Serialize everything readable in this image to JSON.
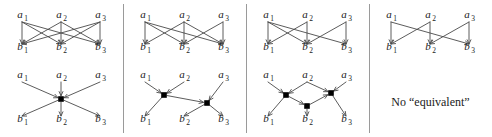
{
  "figure": {
    "width": 492,
    "height": 137,
    "background": "#ffffff",
    "edge_color": "#4a4a4a",
    "node_color": "#000000",
    "divider_color": "#9a9a9a",
    "text_color": "#1a1a1a"
  },
  "labels": {
    "a1": "a",
    "a1sub": "1",
    "a2": "a",
    "a2sub": "2",
    "a3": "a",
    "a3sub": "3",
    "b1": "b",
    "b1sub": "1",
    "b2": "b",
    "b2sub": "2",
    "b3": "b",
    "b3sub": "3"
  },
  "geometry": {
    "panel_width": 123,
    "a_xs": [
      22,
      61,
      100
    ],
    "b_xs": [
      22,
      61,
      100
    ],
    "top": {
      "a_y": 18,
      "b_y": 50,
      "edge_start_y": 22,
      "edge_end_y": 44
    },
    "bottom": {
      "a_y": 78,
      "b_y": 122,
      "edge_start_y": 82,
      "edge_end_y": 116
    }
  },
  "panels": [
    {
      "id": "panel-1-top",
      "name": "complete-bipartite-graph",
      "row": "top",
      "column": 0,
      "type": "bipartite",
      "edges": [
        {
          "from": 0,
          "to": 0
        },
        {
          "from": 0,
          "to": 1
        },
        {
          "from": 0,
          "to": 2
        },
        {
          "from": 1,
          "to": 0
        },
        {
          "from": 1,
          "to": 1
        },
        {
          "from": 1,
          "to": 2
        },
        {
          "from": 2,
          "to": 0
        },
        {
          "from": 2,
          "to": 1
        },
        {
          "from": 2,
          "to": 2
        }
      ]
    },
    {
      "id": "panel-2-top",
      "name": "bipartite-graph-eight-edges",
      "row": "top",
      "column": 1,
      "type": "bipartite",
      "edges": [
        {
          "from": 0,
          "to": 0
        },
        {
          "from": 0,
          "to": 1
        },
        {
          "from": 0,
          "to": 2
        },
        {
          "from": 1,
          "to": 0
        },
        {
          "from": 1,
          "to": 1
        },
        {
          "from": 1,
          "to": 2
        },
        {
          "from": 2,
          "to": 1
        },
        {
          "from": 2,
          "to": 2
        }
      ]
    },
    {
      "id": "panel-3-top",
      "name": "bipartite-graph-six-edges",
      "row": "top",
      "column": 2,
      "type": "bipartite",
      "edges": [
        {
          "from": 0,
          "to": 0
        },
        {
          "from": 0,
          "to": 1
        },
        {
          "from": 0,
          "to": 2
        },
        {
          "from": 1,
          "to": 0
        },
        {
          "from": 1,
          "to": 1
        },
        {
          "from": 2,
          "to": 1
        },
        {
          "from": 2,
          "to": 2
        }
      ]
    },
    {
      "id": "panel-4-top",
      "name": "bipartite-graph-six-edges-alt",
      "row": "top",
      "column": 3,
      "type": "bipartite",
      "edges": [
        {
          "from": 0,
          "to": 0
        },
        {
          "from": 0,
          "to": 2
        },
        {
          "from": 1,
          "to": 0
        },
        {
          "from": 1,
          "to": 1
        },
        {
          "from": 2,
          "to": 1
        },
        {
          "from": 2,
          "to": 2
        }
      ]
    },
    {
      "id": "panel-1-bottom",
      "name": "single-hub-network",
      "row": "bottom",
      "column": 0,
      "type": "hub",
      "hubs": [
        {
          "x": 61,
          "y": 99
        }
      ],
      "in_edges": [
        {
          "from": 0,
          "hub": 0
        },
        {
          "from": 1,
          "hub": 0
        },
        {
          "from": 2,
          "hub": 0
        }
      ],
      "out_edges": [
        {
          "hub": 0,
          "to": 0
        },
        {
          "hub": 0,
          "to": 1
        },
        {
          "hub": 0,
          "to": 2
        }
      ],
      "hub_edges": []
    },
    {
      "id": "panel-2-bottom",
      "name": "two-hub-network",
      "row": "bottom",
      "column": 1,
      "type": "hub",
      "hubs": [
        {
          "x": 41,
          "y": 95
        },
        {
          "x": 84,
          "y": 103
        }
      ],
      "in_edges": [
        {
          "from": 0,
          "hub": 0
        },
        {
          "from": 1,
          "hub": 0
        },
        {
          "from": 2,
          "hub": 1
        }
      ],
      "out_edges": [
        {
          "hub": 0,
          "to": 0
        },
        {
          "hub": 1,
          "to": 1
        },
        {
          "hub": 1,
          "to": 2
        }
      ],
      "hub_edges": [
        {
          "from": 0,
          "to": 1
        }
      ]
    },
    {
      "id": "panel-3-bottom",
      "name": "three-hub-network",
      "row": "bottom",
      "column": 2,
      "type": "hub",
      "hubs": [
        {
          "x": 40,
          "y": 95
        },
        {
          "x": 61,
          "y": 106
        },
        {
          "x": 85,
          "y": 93
        }
      ],
      "in_edges": [
        {
          "from": 0,
          "hub": 0
        },
        {
          "from": 1,
          "hub": 0
        },
        {
          "from": 1,
          "hub": 2
        },
        {
          "from": 2,
          "hub": 2
        }
      ],
      "out_edges": [
        {
          "hub": 0,
          "to": 0
        },
        {
          "hub": 1,
          "to": 1
        },
        {
          "hub": 2,
          "to": 2
        }
      ],
      "hub_edges": [
        {
          "from": 0,
          "to": 1
        },
        {
          "from": 1,
          "to": 2
        }
      ]
    },
    {
      "id": "panel-4-bottom",
      "name": "no-equivalent-note",
      "row": "bottom",
      "column": 3,
      "type": "text",
      "text": "No “equivalent”"
    }
  ]
}
